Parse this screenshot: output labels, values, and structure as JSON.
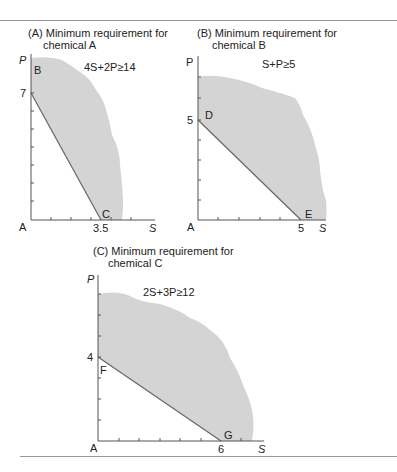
{
  "figure": {
    "panels": [
      {
        "id": "A",
        "title_line1": "(A) Minimum  requirement for",
        "title_line2": "chemical A",
        "constraint": "4S+2P≥14",
        "origin_label": "A",
        "y_axis_label": "P",
        "x_axis_label": "S",
        "y_intercept_label": "7",
        "x_intercept_label": "3.5",
        "y_point_label": "B",
        "x_point_label": "C"
      },
      {
        "id": "B",
        "title_line1": "(B) Minimum  requirement for",
        "title_line2": "chemical B",
        "constraint": "S+P≥5",
        "origin_label": "A",
        "y_axis_label": "P",
        "x_axis_label": "S",
        "y_intercept_label": "5",
        "x_intercept_label": "5",
        "y_point_label": "D",
        "x_point_label": "E"
      },
      {
        "id": "C",
        "title_line1": "(C) Minimum  requirement for",
        "title_line2": "chemical C",
        "constraint": "2S+3P≥12",
        "origin_label": "A",
        "y_axis_label": "P",
        "x_axis_label": "S",
        "y_intercept_label": "4",
        "x_intercept_label": "6",
        "y_point_label": "F",
        "x_point_label": "G"
      }
    ],
    "colors": {
      "feasible_region": "#d4d4d4",
      "axis": "#555555",
      "constraint_line": "#666666",
      "rule": "#9a9a9a"
    }
  }
}
